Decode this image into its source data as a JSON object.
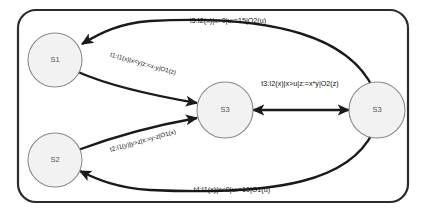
{
  "diagram": {
    "type": "state-machine-efsm",
    "frame": {
      "name": "outer-frame"
    },
    "states": [
      {
        "id": "s1",
        "label": "S1",
        "cx": 55,
        "cy": 60
      },
      {
        "id": "s2",
        "label": "S2",
        "cx": 55,
        "cy": 160
      },
      {
        "id": "s3m",
        "label": "S3",
        "cx": 225,
        "cy": 110
      },
      {
        "id": "s3r",
        "label": "S3",
        "cx": 377,
        "cy": 110
      }
    ],
    "transitions": [
      {
        "id": "t1",
        "label": "t1:I1(x)|x<y|z:=x-y|O1(z)",
        "from": "s1",
        "to": "s3m",
        "label_x": 143,
        "label_y": 64,
        "rotate": 15.5,
        "size": "small"
      },
      {
        "id": "t2",
        "label": "t2:I1(y)|y>z|x:=y-z|O1(x)",
        "from": "s2",
        "to": "s3m",
        "label_x": 143,
        "label_y": 141,
        "rotate": -15.5,
        "size": "small"
      },
      {
        "id": "t3",
        "label": "t3:I2(x)|x>u|z:=x*y|O2(z)",
        "from": "s3m",
        "to": "s3r",
        "label_x": 300,
        "label_y": 84,
        "rotate": 0,
        "size": "normal"
      },
      {
        "id": "t4",
        "label": "t4:I1(x)|x<0|u:=10|O1(u)",
        "from": "s3r",
        "to": "s2",
        "label_x": 232,
        "label_y": 190,
        "rotate": 0,
        "size": "normal"
      },
      {
        "id": "t5",
        "label": "t5:I2(x)|x>0|u:=15|O2(u)",
        "from": "s3r",
        "to": "s1",
        "label_x": 228,
        "label_y": 21,
        "rotate": 0,
        "size": "normal"
      }
    ],
    "colors": {
      "frame_stroke": "#2b2b2b",
      "edge_stroke": "#1a1a1a",
      "node_fill": "#f2f2f2",
      "node_stroke": "#8a8a8a",
      "node_text": "#555555",
      "label_text": "#111111",
      "background": "#ffffff"
    }
  }
}
